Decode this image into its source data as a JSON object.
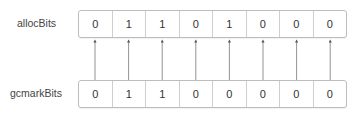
{
  "rows": [
    {
      "label": "allocBits",
      "bits": [
        "0",
        "1",
        "1",
        "0",
        "1",
        "0",
        "0",
        "0"
      ]
    },
    {
      "label": "gcmarkBits",
      "bits": [
        "0",
        "1",
        "1",
        "0",
        "0",
        "0",
        "0",
        "0"
      ]
    }
  ],
  "arrow_direction": "gcmarkBits -> allocBits",
  "colors": {
    "border": "#bdbdbd",
    "arrow": "#555555",
    "text": "#333333"
  }
}
